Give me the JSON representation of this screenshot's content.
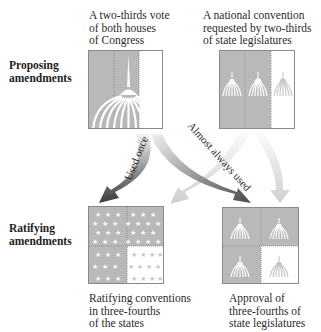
{
  "rows": {
    "proposing": {
      "line1": "Proposing",
      "line2": "amendments"
    },
    "ratifying": {
      "line1": "Ratifying",
      "line2": "amendments"
    }
  },
  "proposal_methods": [
    {
      "lines": [
        "A two-thirds vote",
        "of both houses",
        "of Congress"
      ],
      "icon": "capitol-dome-icon",
      "filled_fraction": "2/3"
    },
    {
      "lines": [
        "A national convention",
        "requested by two-thirds",
        "of state legislatures"
      ],
      "icon": "capitol-dome-icon",
      "filled_fraction": "2/3"
    }
  ],
  "ratification_methods": [
    {
      "lines": [
        "Ratifying conventions",
        "in three-fourths",
        "of the states"
      ],
      "icon": "star-icon",
      "filled_fraction": "3/4"
    },
    {
      "lines": [
        "Approval of",
        "three-fourths of",
        "state legislatures"
      ],
      "icon": "capitol-dome-icon",
      "filled_fraction": "3/4"
    }
  ],
  "arrows": [
    {
      "from": "congress",
      "to": "conventions",
      "label": "Used once",
      "emphasis": "dark"
    },
    {
      "from": "congress",
      "to": "legislatures",
      "label": "Almost always used",
      "emphasis": "dark"
    },
    {
      "from": "national-convention",
      "to": "conventions",
      "label": "",
      "emphasis": "light"
    },
    {
      "from": "national-convention",
      "to": "legislatures",
      "label": "",
      "emphasis": "light"
    }
  ],
  "colors": {
    "fill_gray": "#b9b9b9",
    "border": "#8a8a8a",
    "arrow_dark": "#555555",
    "arrow_light": "#d6d6d6"
  }
}
